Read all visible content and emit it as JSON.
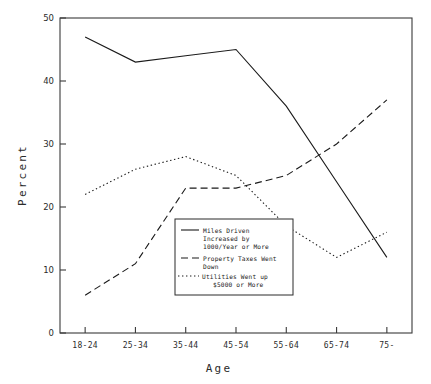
{
  "chart_data": {
    "type": "line",
    "title": "",
    "xlabel": "Age",
    "ylabel": "Percent",
    "categories": [
      "18-24",
      "25-34",
      "35-44",
      "45-54",
      "55-64",
      "65-74",
      "75-"
    ],
    "ylim": [
      0,
      50
    ],
    "yticks": [
      0,
      10,
      20,
      30,
      40,
      50
    ],
    "ytick_labels": [
      "0",
      "10",
      "20",
      "30",
      "40",
      "50"
    ],
    "grid": false,
    "legend_position": "center",
    "series": [
      {
        "name": "Miles Driven Increased by 1000/Year or More",
        "style": "solid",
        "values": [
          47,
          43,
          44,
          45,
          36,
          24,
          12
        ]
      },
      {
        "name": "Property Taxes Went Down",
        "style": "dashed",
        "values": [
          6,
          11,
          23,
          23,
          25,
          30,
          37
        ]
      },
      {
        "name": "Utilities Went up $5000 or More",
        "style": "dotted",
        "values": [
          22,
          26,
          28,
          25,
          17,
          12,
          16
        ]
      }
    ]
  },
  "legend": {
    "entries": [
      {
        "style": "solid",
        "line1": "Miles Driven",
        "line2": "Increased by",
        "line3": "1000/Year or More"
      },
      {
        "style": "dashed",
        "line1": "Property Taxes Went",
        "line2": "Down",
        "line3": ""
      },
      {
        "style": "dotted",
        "line1": "Utilities Went up",
        "line2": "$5000 or More",
        "line3": ""
      }
    ]
  },
  "axes": {
    "y_title": "Percent",
    "x_title": "Age",
    "y_labels": [
      "50",
      "40",
      "30",
      "20",
      "10",
      "0"
    ],
    "x_labels": [
      "18-24",
      "25-34",
      "35-44",
      "45-54",
      "55-64",
      "65-74",
      "75-"
    ]
  },
  "colors": {
    "line": "#1a1a1a",
    "axis": "#3a3a3a",
    "background": "#ffffff",
    "text": "#2b2b2b"
  }
}
